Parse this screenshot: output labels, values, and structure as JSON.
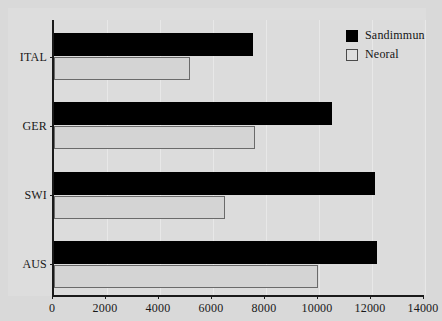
{
  "chart_data": {
    "type": "bar",
    "orientation": "horizontal",
    "title": "",
    "xlabel": "",
    "ylabel": "",
    "categories": [
      "ITAL",
      "GER",
      "SWI",
      "AUS"
    ],
    "series": [
      {
        "name": "Sandimmun",
        "color": "#000000",
        "values": [
          7500,
          10500,
          12100,
          12200
        ]
      },
      {
        "name": "Neoral",
        "color": "#d4d4d4",
        "values": [
          5150,
          7600,
          6450,
          9950
        ]
      }
    ],
    "xlim": [
      0,
      14000
    ],
    "xticks": [
      0,
      2000,
      4000,
      6000,
      8000,
      10000,
      12000,
      14000
    ],
    "xtick_labels": [
      "0",
      "2000",
      "4000",
      "6000",
      "8000",
      "10000",
      "12000",
      "14000"
    ],
    "grid": true,
    "grid_axis": "x",
    "legend_position": "top-right",
    "background_color": "#dcdcdc",
    "axis_color": "#1a1a1a"
  },
  "legend": {
    "items": [
      {
        "label": "Sandimmun",
        "swatch": "filled-black-square"
      },
      {
        "label": "Neoral",
        "swatch": "outlined-white-square"
      }
    ]
  }
}
